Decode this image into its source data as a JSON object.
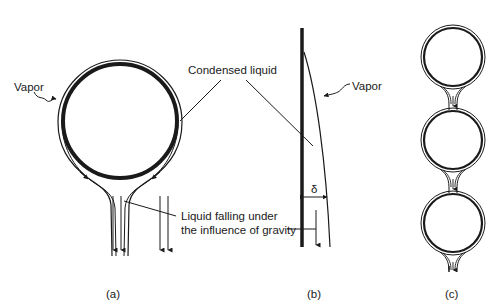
{
  "figure": {
    "panels": [
      {
        "id": "a",
        "caption": "(a)",
        "labels": {
          "vapor": "Vapor",
          "condensed_liquid": "Condensed liquid",
          "falling_line1": "Liquid falling under",
          "falling_line2": "the influence of gravity"
        }
      },
      {
        "id": "b",
        "caption": "(b)",
        "labels": {
          "vapor": "Vapor",
          "film_thickness": "δ"
        }
      },
      {
        "id": "c",
        "caption": "(c)"
      }
    ],
    "colors": {
      "stroke": "#1a1a1a",
      "background": "#ffffff"
    }
  }
}
